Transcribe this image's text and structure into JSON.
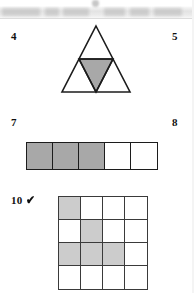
{
  "page": {
    "width": 194,
    "height": 293,
    "background": "#ffffff",
    "kind": "scanned-worksheet-page"
  },
  "header": {
    "text": "",
    "legible": false,
    "band_color": "#e3e3e3",
    "smudges": [
      {
        "left": 2,
        "width": 38
      },
      {
        "left": 45,
        "width": 14
      },
      {
        "left": 63,
        "width": 26
      },
      {
        "left": 104,
        "width": 21
      },
      {
        "left": 130,
        "width": 19
      },
      {
        "left": 154,
        "width": 28
      }
    ]
  },
  "items": [
    {
      "number": "4",
      "label_left": 11,
      "label_top": 30,
      "has_check": false,
      "figure": "triangle-quarters"
    },
    {
      "number": "5",
      "label_left": 172,
      "label_top": 30,
      "has_check": false,
      "figure": null
    },
    {
      "number": "7",
      "label_left": 11,
      "label_top": 116,
      "has_check": false,
      "figure": "strip-of-5"
    },
    {
      "number": "8",
      "label_left": 172,
      "label_top": 116,
      "has_check": false,
      "figure": null
    },
    {
      "number": "10",
      "label_left": 11,
      "label_top": 194,
      "has_check": true,
      "check_glyph": "✔",
      "figure": "grid-4x4"
    }
  ],
  "figures": {
    "triangle": {
      "name": "equilateral-triangle-divided-in-four",
      "total_parts": 4,
      "shaded_parts": 1,
      "shaded_region": "center-inverted-triangle",
      "fill_color": "#a8a8a8",
      "stroke_color": "#1c1c1c",
      "outer_points": "38,4 72,70 4,70",
      "inner_inverted_points": "21,37 55,37 38,70",
      "midline_left": "21,37 55,37",
      "edge_left": "21,37 38,70",
      "edge_right": "55,37 38,70"
    },
    "strip": {
      "name": "row-of-five-squares",
      "total_cells": 5,
      "shaded_cells": 3,
      "cells": [
        true,
        true,
        true,
        false,
        false
      ],
      "fill_color": "#a8a8a8",
      "stroke_color": "#1c1c1c"
    },
    "grid": {
      "name": "four-by-four-grid",
      "rows": 4,
      "columns": 4,
      "total_cells": 16,
      "shaded_cells": 5,
      "cells": [
        [
          true,
          false,
          false,
          false
        ],
        [
          false,
          true,
          false,
          false
        ],
        [
          true,
          true,
          true,
          false
        ],
        [
          false,
          false,
          false,
          false
        ]
      ],
      "fill_color": "#cccccc",
      "stroke_color": "#3a3a3a"
    }
  }
}
